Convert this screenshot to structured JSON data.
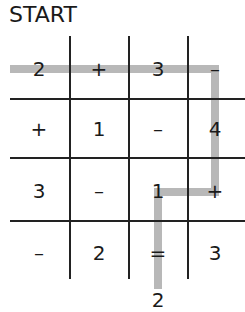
{
  "title": "START",
  "grid": {
    "rows": [
      [
        "2",
        "+",
        "3",
        "–"
      ],
      [
        "+",
        "1",
        "–",
        "4"
      ],
      [
        "3",
        "–",
        "1",
        "+"
      ],
      [
        "–",
        "2",
        "=",
        "3"
      ]
    ]
  },
  "end_value": "2",
  "path": {
    "color": "#b8b8b8",
    "cells": [
      [
        0,
        0
      ],
      [
        0,
        1
      ],
      [
        0,
        2
      ],
      [
        0,
        3
      ],
      [
        1,
        3
      ],
      [
        2,
        3
      ],
      [
        2,
        2
      ],
      [
        3,
        2
      ],
      "end"
    ]
  },
  "colors": {
    "lines": "#222222",
    "text": "#1a1a1a",
    "background": "#ffffff"
  }
}
